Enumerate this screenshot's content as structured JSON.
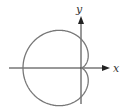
{
  "diagram": {
    "type": "polar-curve",
    "curve": "cardioid r = 1 - cos(theta)",
    "axes": {
      "x_label": "x",
      "y_label": "y"
    },
    "colors": {
      "curve": "#777777",
      "axis": "#333333"
    }
  }
}
